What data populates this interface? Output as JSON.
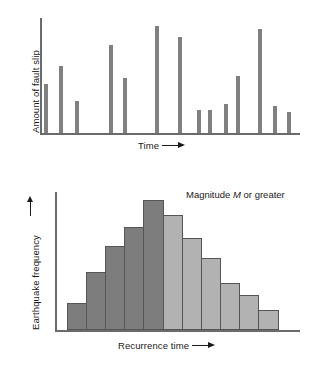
{
  "figure": {
    "panels": [
      "fault-slip-vs-time",
      "earthquake-frequency-vs-recurrence-time"
    ]
  },
  "top_panel": {
    "ylabel": "Amount of fault slip",
    "xlabel": "Time",
    "xlabel_arrow": "right-arrow"
  },
  "bottom_panel": {
    "ylabel": "Earthquake frequency",
    "ylabel_arrow": "up-arrow",
    "xlabel": "Recurrence time",
    "xlabel_arrow": "right-arrow",
    "annotation_prefix": "Magnitude ",
    "annotation_symbol": "M",
    "annotation_suffix": " or greater"
  },
  "colors": {
    "spike_gray": "#808080",
    "bar_dark": "#7d7d7d",
    "bar_light": "#b2b2b2",
    "bar_outline": "#555555",
    "axis": "#6b6b6b",
    "text": "#1a1a1a",
    "background": "#ffffff"
  },
  "chart_data": [
    {
      "type": "bar",
      "id": "fault-slip-vs-time",
      "title": "",
      "xlabel": "Time",
      "ylabel": "Amount of fault slip",
      "grid": false,
      "legend": "none",
      "axis_ticks": "none",
      "note": "Irregular narrow spikes; x position is event time, height is slip amount. Values are normalized 0-100 read off the plot box.",
      "xlim": [
        0,
        100
      ],
      "ylim": [
        0,
        100
      ],
      "x": [
        3,
        9,
        16,
        30,
        36,
        48,
        57,
        65,
        69,
        77,
        83,
        95,
        101,
        109
      ],
      "values": [
        34,
        56,
        23,
        74,
        44,
        96,
        85,
        21,
        21,
        31,
        58,
        92,
        27,
        21
      ],
      "bar_pixels": [
        {
          "x": 44,
          "top": 84,
          "height": 49
        },
        {
          "x": 59,
          "top": 66,
          "height": 67
        },
        {
          "x": 75,
          "top": 101,
          "height": 32
        },
        {
          "x": 109,
          "top": 45,
          "height": 88
        },
        {
          "x": 123,
          "top": 78,
          "height": 55
        },
        {
          "x": 155,
          "top": 26,
          "height": 107
        },
        {
          "x": 178,
          "top": 37,
          "height": 96
        },
        {
          "x": 197,
          "top": 110,
          "height": 23
        },
        {
          "x": 208,
          "top": 110,
          "height": 23
        },
        {
          "x": 224,
          "top": 104,
          "height": 29
        },
        {
          "x": 236,
          "top": 76,
          "height": 57
        },
        {
          "x": 258,
          "top": 29,
          "height": 104
        },
        {
          "x": 273,
          "top": 106,
          "height": 27
        },
        {
          "x": 287,
          "top": 112,
          "height": 21
        }
      ]
    },
    {
      "type": "bar",
      "id": "earthquake-frequency-vs-recurrence-time",
      "title": "",
      "xlabel": "Recurrence time",
      "ylabel": "Earthquake frequency",
      "annotation": "Magnitude M or greater",
      "grid": false,
      "legend": "none",
      "axis_ticks": "none",
      "note": "Bell-shaped histogram of recurrence intervals. 5 dark bars left of and including the mode tail, 6 light bars to the right. Values normalized 0-100.",
      "xlim": [
        0,
        11
      ],
      "ylim": [
        0,
        100
      ],
      "categories": [
        "1",
        "2",
        "3",
        "4",
        "5",
        "6",
        "7",
        "8",
        "9",
        "10",
        "11"
      ],
      "values": [
        19,
        43,
        62,
        76,
        100,
        88,
        72,
        58,
        40,
        28,
        16
      ],
      "bar_colors": [
        "dark",
        "dark",
        "dark",
        "dark",
        "dark",
        "light",
        "light",
        "light",
        "light",
        "light",
        "light"
      ],
      "bar_pixels": [
        {
          "x": 67,
          "width": 20,
          "top": 303,
          "height": 27
        },
        {
          "x": 86,
          "width": 20,
          "top": 272,
          "height": 58
        },
        {
          "x": 105,
          "width": 20,
          "top": 246,
          "height": 84
        },
        {
          "x": 124,
          "width": 20,
          "top": 227,
          "height": 103
        },
        {
          "x": 143,
          "width": 21,
          "top": 200,
          "height": 130
        },
        {
          "x": 163,
          "width": 20,
          "top": 215,
          "height": 115
        },
        {
          "x": 182,
          "width": 20,
          "top": 238,
          "height": 92
        },
        {
          "x": 201,
          "width": 20,
          "top": 258,
          "height": 72
        },
        {
          "x": 220,
          "width": 20,
          "top": 283,
          "height": 47
        },
        {
          "x": 239,
          "width": 20,
          "top": 295,
          "height": 35
        },
        {
          "x": 258,
          "width": 21,
          "top": 310,
          "height": 20
        }
      ]
    }
  ]
}
